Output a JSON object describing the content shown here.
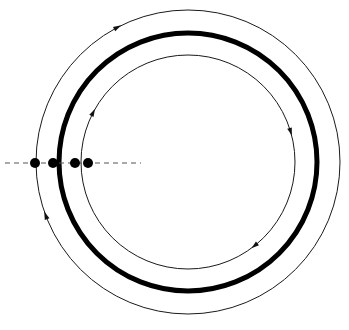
{
  "figure": {
    "title": "",
    "width": 349,
    "height": 330,
    "background": "#ffffff"
  },
  "geometry": {
    "center": {
      "x": 188,
      "y": 162
    },
    "orbits": [
      {
        "name": "outer-orbit",
        "radius": 152,
        "stroke": "#1a1a1a",
        "stroke_width": 1,
        "direction": "clockwise",
        "arrow_angles_deg": [
          201,
          118
        ]
      },
      {
        "name": "thick-orbit",
        "radius": 129,
        "stroke": "#000000",
        "stroke_width": 5,
        "direction": "none",
        "arrow_angles_deg": []
      },
      {
        "name": "inner-orbit",
        "radius": 107,
        "stroke": "#1a1a1a",
        "stroke_width": 1,
        "direction": "clockwise",
        "arrow_angles_deg": [
          153,
          17,
          309
        ]
      }
    ],
    "axis": {
      "name": "horizontal-dashed-axis",
      "y": 163,
      "x_start": 5,
      "x_end": 141,
      "stroke": "#555555",
      "stroke_width": 1.2,
      "dash_pattern": "5 4"
    },
    "points": [
      {
        "label": "p1",
        "x": 35,
        "y": 163,
        "r": 5,
        "fill": "#000000"
      },
      {
        "label": "p2",
        "x": 53,
        "y": 163,
        "r": 5,
        "fill": "#000000"
      },
      {
        "label": "p3",
        "x": 75,
        "y": 163,
        "r": 5,
        "fill": "#000000"
      },
      {
        "label": "p4",
        "x": 88,
        "y": 163,
        "r": 5,
        "fill": "#000000"
      }
    ]
  }
}
